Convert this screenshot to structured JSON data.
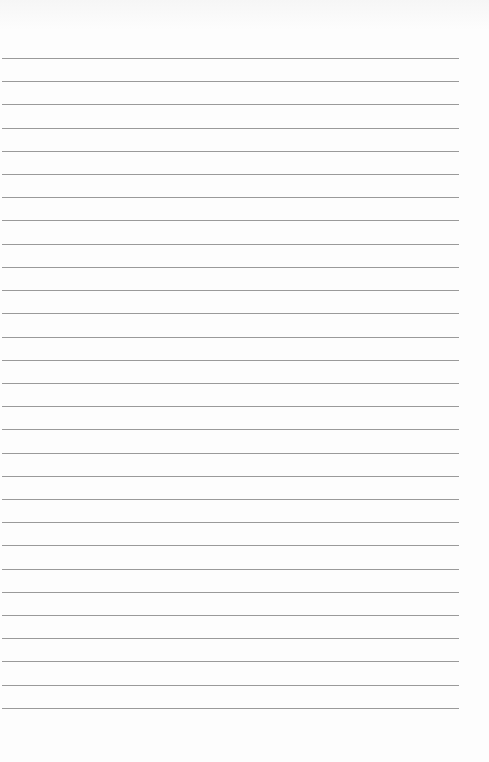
{
  "page": {
    "type": "lined-paper",
    "line_count": 29,
    "first_line_y": 58,
    "line_spacing": 23.21,
    "line_color": "#9a9a9a",
    "background_color": "#fdfdfd"
  }
}
